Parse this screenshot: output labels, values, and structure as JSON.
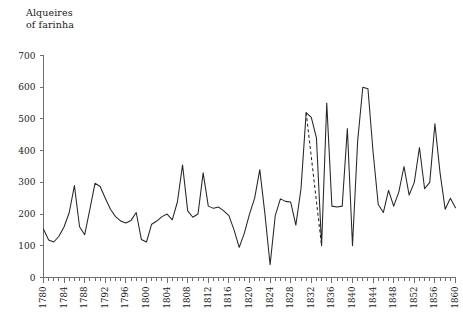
{
  "chart_data": {
    "type": "line",
    "title": "Alqueires\nof farinha",
    "xlabel": "",
    "ylabel": "Alqueires of farinha",
    "xlim": [
      1780,
      1860
    ],
    "ylim": [
      0,
      700
    ],
    "yticks": [
      0,
      100,
      200,
      300,
      400,
      500,
      600,
      700
    ],
    "xticks": [
      1780,
      1784,
      1788,
      1792,
      1796,
      1800,
      1804,
      1808,
      1812,
      1816,
      1820,
      1824,
      1828,
      1832,
      1836,
      1840,
      1844,
      1848,
      1852,
      1856,
      1860
    ],
    "xtick_labels": [
      "1780",
      "1784",
      "1788",
      "1792",
      "1796",
      "1800",
      "1804",
      "1808",
      "1812",
      "1816",
      "1820",
      "1824",
      "1828",
      "1832",
      "1836",
      "1840",
      "1844",
      "1848",
      "1852",
      "1856",
      "1860"
    ],
    "ytick_labels": [
      "0",
      "100",
      "200",
      "300",
      "400",
      "500",
      "600",
      "700"
    ],
    "xtick_minor_step": 1,
    "grid": false,
    "legend": false,
    "line_color": "#262626",
    "axis_color": "#6f6f6f",
    "series": [
      {
        "name": "Alqueires of farinha",
        "style": "solid",
        "x": [
          1780,
          1781,
          1782,
          1783,
          1784,
          1785,
          1786,
          1787,
          1788,
          1789,
          1790,
          1791,
          1792,
          1793,
          1794,
          1795,
          1796,
          1797,
          1798,
          1799,
          1800,
          1801,
          1802,
          1803,
          1804,
          1805,
          1806,
          1807,
          1808,
          1809,
          1810,
          1811,
          1812,
          1813,
          1814,
          1815,
          1816,
          1817,
          1818,
          1819,
          1820,
          1821,
          1822,
          1823,
          1824,
          1825,
          1826,
          1827,
          1828,
          1829,
          1830,
          1831,
          1832,
          1833
        ],
        "values": [
          152,
          118,
          112,
          130,
          160,
          205,
          290,
          160,
          135,
          215,
          297,
          287,
          250,
          215,
          192,
          178,
          172,
          180,
          205,
          120,
          112,
          168,
          178,
          192,
          200,
          182,
          238,
          355,
          210,
          190,
          200,
          330,
          225,
          218,
          222,
          210,
          195,
          150,
          95,
          140,
          200,
          250,
          340,
          200,
          40,
          195,
          248,
          240,
          238,
          165,
          280,
          520,
          505,
          440
        ]
      },
      {
        "name": "Alqueires of farinha (interpolated)",
        "style": "dashed",
        "x": [
          1831,
          1834
        ],
        "values": [
          520,
          100
        ]
      },
      {
        "name": "Alqueires of farinha (continued)",
        "style": "solid",
        "x": [
          1833,
          1834,
          1835,
          1836,
          1837,
          1838,
          1839,
          1840,
          1841,
          1842,
          1843,
          1844,
          1845,
          1846,
          1847,
          1848,
          1849,
          1850,
          1851,
          1852,
          1853,
          1854,
          1855,
          1856,
          1857,
          1858,
          1859,
          1860
        ],
        "values": [
          440,
          100,
          550,
          225,
          222,
          225,
          470,
          100,
          430,
          600,
          595,
          395,
          230,
          205,
          275,
          225,
          270,
          350,
          260,
          300,
          410,
          280,
          300,
          485,
          330,
          215,
          250,
          220
        ]
      }
    ],
    "annotations": [
      {
        "type": "dashed-segment",
        "note": "interpolated gap 1831-1834"
      }
    ]
  }
}
